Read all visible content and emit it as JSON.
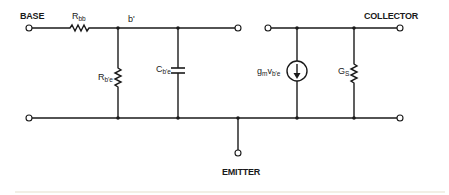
{
  "diagram": {
    "terminals": {
      "base": "BASE",
      "collector": "COLLECTOR",
      "emitter": "EMITTER"
    },
    "nodes": {
      "b_prime": "b'"
    },
    "components": {
      "rbb": {
        "main": "R",
        "sub": "bb"
      },
      "rbe": {
        "main": "R",
        "sub": "b'e"
      },
      "cbe": {
        "main": "C",
        "sub": "b'e"
      },
      "gm": {
        "main": "g",
        "sub1": "m",
        "mid": "v",
        "sub2": "b'e"
      },
      "gs": {
        "main": "G",
        "sub": "S"
      }
    },
    "colors": {
      "ink": "#1a1a1a",
      "background": "#ffffff"
    }
  }
}
